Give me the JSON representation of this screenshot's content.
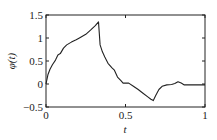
{
  "chart_data": {
    "type": "line",
    "title": "",
    "xlabel": "t",
    "ylabel": "φ(t)",
    "xlim": [
      0,
      1
    ],
    "ylim": [
      -0.5,
      1.5
    ],
    "xticks": [
      0,
      0.5,
      1
    ],
    "xtick_labels": [
      "0",
      "0.5",
      "1"
    ],
    "yticks": [
      -0.5,
      0,
      0.5,
      1,
      1.5
    ],
    "ytick_labels": [
      "−0.5",
      "0",
      "0.5",
      "1",
      "1.5"
    ],
    "grid": false,
    "legend": null,
    "series": [
      {
        "name": "φ(t)",
        "color": "#222222",
        "x": [
          0,
          0.012,
          0.025,
          0.04,
          0.06,
          0.075,
          0.09,
          0.11,
          0.13,
          0.16,
          0.19,
          0.21,
          0.25,
          0.28,
          0.31,
          0.33,
          0.335,
          0.34,
          0.355,
          0.37,
          0.39,
          0.415,
          0.43,
          0.45,
          0.47,
          0.485,
          0.5,
          0.52,
          0.55,
          0.58,
          0.61,
          0.64,
          0.66,
          0.675,
          0.69,
          0.71,
          0.73,
          0.76,
          0.79,
          0.81,
          0.83,
          0.85,
          0.87,
          0.9,
          0.95,
          1.0
        ],
        "y": [
          0,
          0.2,
          0.32,
          0.42,
          0.52,
          0.63,
          0.66,
          0.78,
          0.85,
          0.91,
          0.96,
          1.0,
          1.08,
          1.17,
          1.27,
          1.35,
          1.1,
          0.85,
          0.7,
          0.59,
          0.45,
          0.35,
          0.3,
          0.15,
          0.08,
          0.02,
          0.02,
          0.02,
          -0.05,
          -0.12,
          -0.2,
          -0.28,
          -0.33,
          -0.36,
          -0.25,
          -0.12,
          -0.05,
          -0.02,
          -0.01,
          0.01,
          0.05,
          0.02,
          -0.02,
          -0.02,
          -0.02,
          -0.02
        ]
      }
    ]
  }
}
